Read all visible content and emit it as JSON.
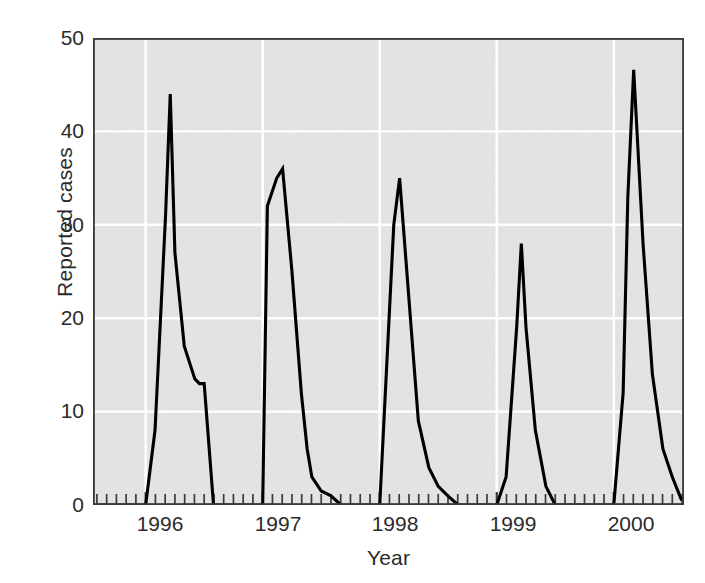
{
  "chart_data": {
    "type": "line",
    "title": "",
    "xlabel": "Year",
    "ylabel": "Reported cases",
    "ylim": [
      0,
      50
    ],
    "yticks": [
      0,
      10,
      20,
      30,
      40,
      50
    ],
    "xticks": [
      "1996",
      "1997",
      "1998",
      "1999",
      "2000"
    ],
    "xlim": [
      "1995.55",
      "2000.60"
    ],
    "grid": "white horizontal and vertical gridlines on gray panel",
    "legend": "none",
    "minor_tick_interval_months": 1,
    "series": [
      {
        "name": "Reported cases",
        "color": "#000000",
        "x": [
          1995.58,
          1995.67,
          1995.75,
          1995.83,
          1995.92,
          1996.0,
          1996.08,
          1996.17,
          1996.21,
          1996.25,
          1996.33,
          1996.42,
          1996.46,
          1996.5,
          1996.58,
          1996.67,
          1996.75,
          1996.83,
          1996.92,
          1997.0,
          1997.04,
          1997.12,
          1997.17,
          1997.25,
          1997.33,
          1997.38,
          1997.42,
          1997.5,
          1997.58,
          1997.67,
          1997.75,
          1997.83,
          1997.92,
          1998.0,
          1998.08,
          1998.12,
          1998.17,
          1998.25,
          1998.33,
          1998.42,
          1998.5,
          1998.58,
          1998.67,
          1998.75,
          1998.83,
          1998.92,
          1999.0,
          1999.08,
          1999.17,
          1999.21,
          1999.25,
          1999.33,
          1999.42,
          1999.5,
          1999.58,
          1999.67,
          1999.75,
          1999.83,
          1999.92,
          2000.0,
          2000.08,
          2000.12,
          2000.17,
          2000.25,
          2000.33,
          2000.42,
          2000.5,
          2000.58
        ],
        "y": [
          0,
          0,
          0,
          0,
          0,
          0,
          8,
          31,
          44,
          27,
          17,
          13.5,
          13,
          13,
          0,
          0,
          0,
          0,
          0,
          0,
          32,
          35,
          36,
          25,
          12,
          6,
          3,
          1.5,
          1,
          0,
          0,
          0,
          0,
          0,
          20,
          30,
          35,
          22,
          9,
          4,
          2,
          1,
          0,
          0,
          0,
          0,
          0,
          3,
          19,
          28,
          19,
          8,
          2,
          0,
          0,
          0,
          0,
          0,
          0,
          0,
          12,
          33,
          46.6,
          28,
          14,
          6,
          3,
          0.5
        ]
      }
    ],
    "annotations": {
      "peak_1996": 44,
      "peak_1997": 36,
      "peak_1998": 35,
      "peak_1999": 28,
      "peak_2000": 46.6,
      "shoulder_1996_plateau": 13
    },
    "colors": {
      "panel_background": "#e4e4e4",
      "gridline": "#ffffff",
      "axis_border": "#3a3a3a",
      "line": "#000000",
      "text": "#2b2b2b",
      "page_background": "#ffffff"
    }
  }
}
